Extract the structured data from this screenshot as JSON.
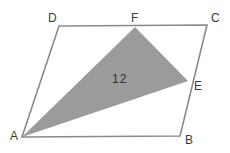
{
  "figure": {
    "type": "geometry-diagram",
    "background_color": "#ffffff",
    "stroke_color": "#8a8a8a",
    "stroke_width": 1.6,
    "shaded_fill_color": "#9b9b9b",
    "label_color": "#3a3a3a",
    "canvas": {
      "width": 230,
      "height": 153
    }
  },
  "points": {
    "A": {
      "label": "A",
      "x": 22,
      "y": 137,
      "label_x": 10,
      "label_y": 130
    },
    "B": {
      "label": "B",
      "x": 180,
      "y": 136,
      "label_x": 185,
      "label_y": 134
    },
    "C": {
      "label": "C",
      "x": 207,
      "y": 25,
      "label_x": 211,
      "label_y": 12
    },
    "D": {
      "label": "D",
      "x": 59,
      "y": 26,
      "label_x": 48,
      "label_y": 12
    },
    "E": {
      "label": "E",
      "x": 188,
      "y": 81,
      "label_x": 194,
      "label_y": 80
    },
    "F": {
      "label": "F",
      "x": 135,
      "y": 27,
      "label_x": 131,
      "label_y": 12
    }
  },
  "shapes": {
    "parallelogram": {
      "name": "parallelogram-ABCD",
      "vertex_order": "A,B,C,D",
      "points": "22,137 180,136 207,25 59,26"
    },
    "shaded_triangle": {
      "name": "triangle-AFE",
      "vertex_order": "A,F,E",
      "points": "22,137 135,27 188,81",
      "area_label": "12",
      "area_label_x": 120,
      "area_label_y": 79
    }
  }
}
